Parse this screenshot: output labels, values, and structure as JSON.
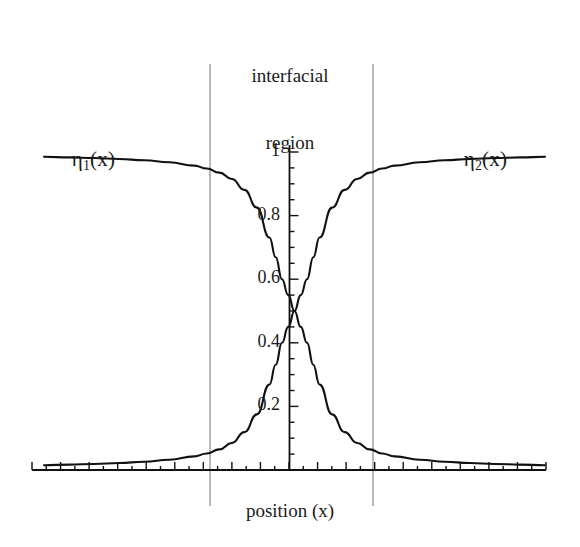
{
  "figure": {
    "width": 580,
    "height": 547,
    "background": "#ffffff",
    "ink_color": "#1a1a1a",
    "guide_color": "#8a8a8a"
  },
  "title": {
    "line1": "interfacial",
    "line2": "region"
  },
  "axes": {
    "xlabel": "position (x)",
    "ylabel": ""
  },
  "series_labels": {
    "left": {
      "eta": "η",
      "sub": "1",
      "arg": "(x)"
    },
    "right": {
      "eta": "η",
      "sub": "2",
      "arg": "(x)"
    }
  },
  "ytick_labels": [
    "1",
    "0.8",
    "0.6",
    "0.4",
    "0.2"
  ],
  "annotations": {
    "interfacial_region_left_boundary": "",
    "interfacial_region_right_boundary": ""
  },
  "chart_data": {
    "type": "line",
    "title": "interfacial region",
    "xlabel": "position (x)",
    "ylabel": "",
    "xlim": [
      -10,
      10
    ],
    "ylim": [
      0,
      1.04
    ],
    "grid": false,
    "legend": "inline-curve-labels",
    "yticks": [
      0.2,
      0.4,
      0.6,
      0.8,
      1
    ],
    "ytick_labels": [
      "0.2",
      "0.4",
      "0.6",
      "0.8",
      "1"
    ],
    "xticks_labeled": false,
    "crossing_point": {
      "x": 0,
      "y": 0.5
    },
    "interfacial_region": {
      "x_start": -2.5,
      "x_end": 2.4
    },
    "x": [
      -10,
      -9,
      -8,
      -7,
      -6,
      -5,
      -4,
      -3.5,
      -3,
      -2.5,
      -2,
      -1.5,
      -1,
      -0.75,
      -0.5,
      -0.25,
      0,
      0.25,
      0.5,
      0.75,
      1,
      1.5,
      2,
      2.5,
      3,
      3.5,
      4,
      5,
      6,
      7,
      8,
      9,
      10
    ],
    "series": [
      {
        "name": "η1(x)",
        "color": "#111111",
        "description": "decreasing sigmoid from 1 to 0",
        "values": [
          0.985,
          0.983,
          0.981,
          0.978,
          0.974,
          0.968,
          0.957,
          0.948,
          0.935,
          0.915,
          0.881,
          0.825,
          0.731,
          0.669,
          0.6,
          0.55,
          0.5,
          0.45,
          0.4,
          0.331,
          0.269,
          0.175,
          0.119,
          0.085,
          0.065,
          0.052,
          0.043,
          0.032,
          0.026,
          0.022,
          0.019,
          0.017,
          0.015
        ]
      },
      {
        "name": "η2(x)",
        "color": "#111111",
        "description": "increasing sigmoid from 0 to 1",
        "values": [
          0.015,
          0.017,
          0.019,
          0.022,
          0.026,
          0.032,
          0.043,
          0.052,
          0.065,
          0.085,
          0.119,
          0.175,
          0.269,
          0.331,
          0.4,
          0.45,
          0.5,
          0.55,
          0.6,
          0.669,
          0.731,
          0.825,
          0.881,
          0.915,
          0.935,
          0.948,
          0.957,
          0.968,
          0.974,
          0.978,
          0.981,
          0.983,
          0.985
        ]
      }
    ]
  }
}
